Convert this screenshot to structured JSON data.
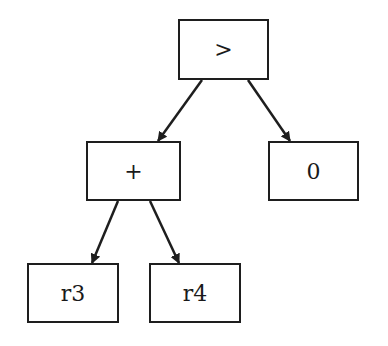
{
  "diagram": {
    "type": "expression-tree",
    "colors": {
      "stroke": "#1e1e1e",
      "text": "#1a1a1a",
      "background": "#ffffff"
    },
    "nodes": [
      {
        "id": "gt",
        "label": ">",
        "x": 178,
        "y": 19,
        "w": 91,
        "h": 61
      },
      {
        "id": "plus",
        "label": "+",
        "x": 86,
        "y": 141,
        "w": 95,
        "h": 60
      },
      {
        "id": "zero",
        "label": "0",
        "x": 268,
        "y": 141,
        "w": 91,
        "h": 60
      },
      {
        "id": "r3",
        "label": "r3",
        "x": 27,
        "y": 263,
        "w": 92,
        "h": 60
      },
      {
        "id": "r4",
        "label": "r4",
        "x": 149,
        "y": 263,
        "w": 92,
        "h": 60
      }
    ],
    "edges": [
      {
        "from": "gt",
        "to": "plus",
        "x1": 202,
        "y1": 80,
        "x2": 158,
        "y2": 141
      },
      {
        "from": "gt",
        "to": "zero",
        "x1": 248,
        "y1": 80,
        "x2": 290,
        "y2": 141
      },
      {
        "from": "plus",
        "to": "r3",
        "x1": 118,
        "y1": 201,
        "x2": 92,
        "y2": 263
      },
      {
        "from": "plus",
        "to": "r4",
        "x1": 150,
        "y1": 201,
        "x2": 179,
        "y2": 263
      }
    ]
  }
}
